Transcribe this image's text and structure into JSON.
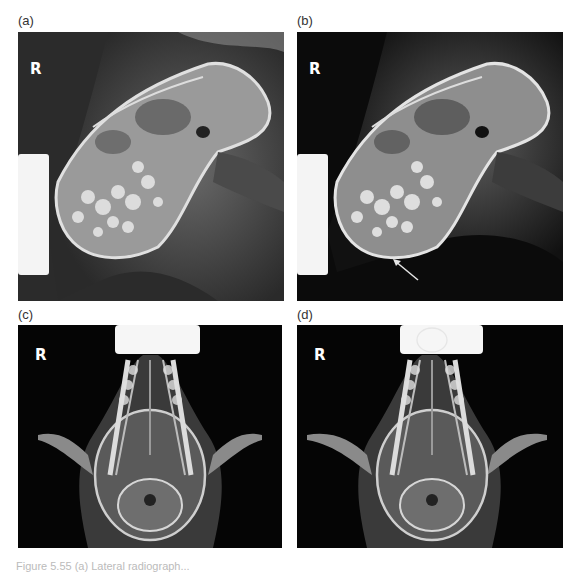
{
  "figure": {
    "panels": [
      {
        "id": "a",
        "label": "(a)",
        "side_marker": "R",
        "view": "lateral"
      },
      {
        "id": "b",
        "label": "(b)",
        "side_marker": "R",
        "view": "lateral",
        "annotation": "arrow"
      },
      {
        "id": "c",
        "label": "(c)",
        "side_marker": "R",
        "view": "ventrodorsal"
      },
      {
        "id": "d",
        "label": "(d)",
        "side_marker": "R",
        "view": "ventrodorsal",
        "annotation": "ellipse"
      }
    ],
    "caption": "Figure 5.55 (a) Lateral radiograph..."
  },
  "colors": {
    "background": "#0d0d0d",
    "bone": "#d8d8d8",
    "soft_tissue": "#5a5a5a",
    "marker_block": "#f4f4f4",
    "annotation": "#e6e6e6"
  }
}
